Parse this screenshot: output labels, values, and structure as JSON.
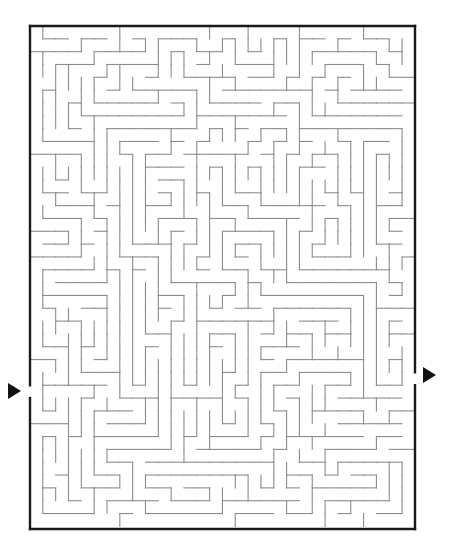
{
  "page": {
    "background_color": "#ffffff",
    "width": 454,
    "height": 553
  },
  "maze": {
    "kind": "rectangular-perfect-maze",
    "columns": 30,
    "rows": 39,
    "cell_size": 12.83,
    "origin_x": 30,
    "origin_y": 26,
    "width_px": 385,
    "height_px": 503,
    "border_color": "#1a1a1a",
    "border_width": 2.4,
    "wall_color": "#8c8c8c",
    "wall_width": 1.1,
    "seed": 20240517,
    "entrance": {
      "label": "entrance",
      "side": "left",
      "row": 28,
      "arrow_color": "#111111",
      "arrow_x": 8,
      "arrow_y": 391,
      "arrow_size": 13,
      "arrow_direction": "right"
    },
    "exit": {
      "label": "exit",
      "side": "right",
      "row": 27,
      "arrow_color": "#111111",
      "arrow_x": 423,
      "arrow_y": 375,
      "arrow_size": 13,
      "arrow_direction": "right"
    }
  }
}
